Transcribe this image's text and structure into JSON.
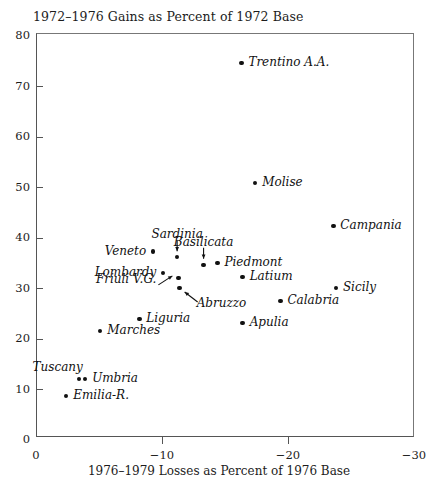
{
  "chart_data": {
    "type": "scatter",
    "title": "1972–1976 Gains as Percent of 1972 Base",
    "xlabel": "1976–1979 Losses as Percent of 1976 Base",
    "ylabel": "1972–1976 Gains as Percent of 1972 Base",
    "xlim": [
      0,
      -30
    ],
    "ylim": [
      0,
      80
    ],
    "xticks": [
      "0",
      "−10",
      "−20",
      "−30"
    ],
    "xtick_values": [
      0,
      -10,
      -20,
      -30
    ],
    "yticks": [
      "0",
      "10",
      "20",
      "30",
      "40",
      "50",
      "60",
      "70",
      "80"
    ],
    "ytick_values": [
      0,
      10,
      20,
      30,
      40,
      50,
      60,
      70,
      80
    ],
    "grid": false,
    "legend": "none",
    "points": [
      {
        "name": "Trentino A.A.",
        "x": -16.3,
        "y": 74.7,
        "label_pos": "right"
      },
      {
        "name": "Molise",
        "x": -17.4,
        "y": 50.9,
        "label_pos": "right"
      },
      {
        "name": "Campania",
        "x": -23.6,
        "y": 42.4,
        "label_pos": "right"
      },
      {
        "name": "Sardinia",
        "x": -11.2,
        "y": 36.2,
        "label_pos": "arrow-down"
      },
      {
        "name": "Veneto",
        "x": -9.3,
        "y": 37.3,
        "label_pos": "left"
      },
      {
        "name": "Basilicata",
        "x": -13.3,
        "y": 34.7,
        "label_pos": "arrow-down"
      },
      {
        "name": "Piedmont",
        "x": -14.4,
        "y": 35.1,
        "label_pos": "right"
      },
      {
        "name": "Lombardy",
        "x": -10.1,
        "y": 33.1,
        "label_pos": "left"
      },
      {
        "name": "Latium",
        "x": -16.4,
        "y": 32.3,
        "label_pos": "right"
      },
      {
        "name": "Friuli V.G.",
        "x": -11.3,
        "y": 32.1,
        "label_pos": "arrow-left"
      },
      {
        "name": "Sicily",
        "x": -23.8,
        "y": 30.1,
        "label_pos": "right"
      },
      {
        "name": "Abruzzo",
        "x": -11.4,
        "y": 30.1,
        "label_pos": "arrow-down-right"
      },
      {
        "name": "Calabria",
        "x": -19.4,
        "y": 27.5,
        "label_pos": "right"
      },
      {
        "name": "Liguria",
        "x": -8.2,
        "y": 24.0,
        "label_pos": "right"
      },
      {
        "name": "Apulia",
        "x": -16.4,
        "y": 23.2,
        "label_pos": "right"
      },
      {
        "name": "Marches",
        "x": -5.1,
        "y": 21.6,
        "label_pos": "right"
      },
      {
        "name": "Tuscany",
        "x": -3.4,
        "y": 12.1,
        "label_pos": "above-left"
      },
      {
        "name": "Umbria",
        "x": -3.9,
        "y": 12.1,
        "label_pos": "right"
      },
      {
        "name": "Emilia-R.",
        "x": -2.4,
        "y": 8.7,
        "label_pos": "right"
      }
    ]
  },
  "axes": {
    "y_ticks": [
      {
        "label": "80",
        "value": 80
      },
      {
        "label": "70",
        "value": 70
      },
      {
        "label": "60",
        "value": 60
      },
      {
        "label": "50",
        "value": 50
      },
      {
        "label": "40",
        "value": 40
      },
      {
        "label": "30",
        "value": 30
      },
      {
        "label": "20",
        "value": 20
      },
      {
        "label": "10",
        "value": 10
      },
      {
        "label": "0",
        "value": 0
      }
    ],
    "x_ticks": [
      {
        "label": "0",
        "value": 0
      },
      {
        "label": "−10",
        "value": -10
      },
      {
        "label": "−20",
        "value": -20
      },
      {
        "label": "−30",
        "value": -30
      }
    ]
  },
  "colors": {
    "point": "#111111",
    "frame": "#555555",
    "text": "#1c1c1c",
    "background": "#ffffff"
  }
}
